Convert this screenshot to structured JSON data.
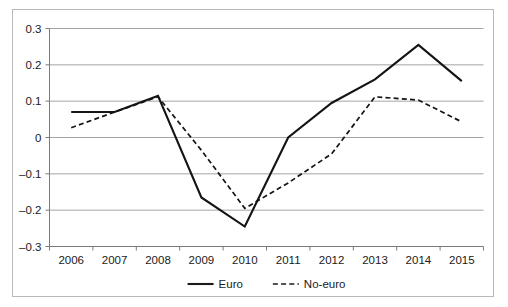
{
  "figure": {
    "kind": "line-chart",
    "background_color": "#ffffff",
    "frame_color": "#b9b9b9",
    "gridline_color": "#9a9a9a",
    "axis_color": "#7a7a7a",
    "text_color": "#1a1a1a"
  },
  "chart_data": {
    "type": "line",
    "title": "",
    "subtitle": "",
    "xlabel": "",
    "ylabel": "",
    "categories": [
      "2006",
      "2007",
      "2008",
      "2009",
      "2010",
      "2011",
      "2012",
      "2013",
      "2014",
      "2015"
    ],
    "x": [
      2006,
      2007,
      2008,
      2009,
      2010,
      2011,
      2012,
      2013,
      2014,
      2015
    ],
    "series": [
      {
        "name": "Euro",
        "style": "solid",
        "color": "#141414",
        "values": [
          0.07,
          0.07,
          0.115,
          -0.165,
          -0.245,
          0.0,
          0.095,
          0.16,
          0.255,
          0.155
        ]
      },
      {
        "name": "No-euro",
        "style": "dashed",
        "color": "#141414",
        "values": [
          0.027,
          0.07,
          0.112,
          -0.035,
          -0.195,
          -0.125,
          -0.045,
          0.112,
          0.103,
          0.043
        ]
      }
    ],
    "ylim": [
      -0.3,
      0.3
    ],
    "yticks": [
      0.3,
      0.2,
      0.1,
      0,
      -0.1,
      -0.2,
      -0.3
    ],
    "ytick_labels": [
      "0.3",
      "0.2",
      "0.1",
      "0",
      "–0.1",
      "–0.2",
      "–0.3"
    ],
    "xtick_labels": [
      "2006",
      "2007",
      "2008",
      "2009",
      "2010",
      "2011",
      "2012",
      "2013",
      "2014",
      "2015"
    ],
    "grid": true,
    "grid_axis": "y",
    "legend": {
      "position": "bottom",
      "entries": [
        {
          "label": "Euro",
          "style": "solid"
        },
        {
          "label": "No-euro",
          "style": "dashed"
        }
      ]
    }
  }
}
